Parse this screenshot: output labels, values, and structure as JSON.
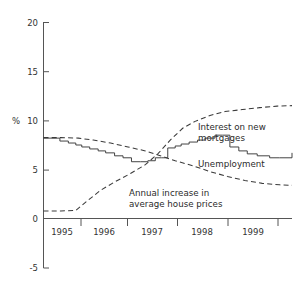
{
  "chart_data": {
    "type": "line",
    "title": "",
    "xlabel": "",
    "ylabel": "%",
    "ylim": [
      -5,
      20
    ],
    "xlim": [
      1994.85,
      1999.85
    ],
    "grid": false,
    "legend_position": "inline-annotations",
    "yticks": [
      "-5",
      "0",
      "5",
      "10",
      "15",
      "20"
    ],
    "ytick_values": [
      -5,
      0,
      5,
      10,
      15,
      20
    ],
    "xticks": [
      "1995",
      "1996",
      "1997",
      "1998",
      "1999"
    ],
    "xtick_values": [
      1995,
      1996,
      1997,
      1998,
      1999
    ],
    "series": [
      {
        "name": "Interest on new mortgages",
        "style": "step",
        "x": [
          1994.85,
          1995.1,
          1995.18,
          1995.35,
          1995.5,
          1995.62,
          1995.78,
          1995.95,
          1996.1,
          1996.28,
          1996.45,
          1996.62,
          1996.8,
          1996.95,
          1997.1,
          1997.22,
          1997.35,
          1997.5,
          1997.62,
          1997.78,
          1997.95,
          1998.1,
          1998.3,
          1998.45,
          1998.6,
          1998.78,
          1998.95,
          1999.15,
          1999.4,
          1999.6,
          1999.85
        ],
        "y": [
          8.2,
          8.2,
          7.9,
          7.7,
          7.5,
          7.3,
          7.1,
          6.9,
          6.7,
          6.4,
          6.2,
          5.8,
          5.8,
          5.9,
          6.2,
          6.2,
          7.2,
          7.4,
          7.6,
          7.8,
          8.0,
          8.2,
          8.5,
          8.5,
          7.3,
          6.9,
          6.6,
          6.4,
          6.2,
          6.2,
          6.7
        ]
      },
      {
        "name": "Unemployment",
        "style": "dashed",
        "x": [
          1994.85,
          1995.2,
          1995.55,
          1995.85,
          1996.2,
          1996.55,
          1996.9,
          1997.2,
          1997.5,
          1997.85,
          1998.2,
          1998.55,
          1998.9,
          1999.25,
          1999.6,
          1999.85
        ],
        "y": [
          8.25,
          8.25,
          8.2,
          8.0,
          7.7,
          7.3,
          6.9,
          6.4,
          5.9,
          5.4,
          4.8,
          4.3,
          3.9,
          3.6,
          3.45,
          3.4
        ]
      },
      {
        "name": "Annual increase in average house prices",
        "style": "dashed",
        "x": [
          1994.85,
          1995.2,
          1995.5,
          1995.75,
          1996.0,
          1996.3,
          1996.6,
          1996.9,
          1997.15,
          1997.4,
          1997.65,
          1997.9,
          1998.2,
          1998.5,
          1998.85,
          1999.2,
          1999.55,
          1999.85
        ],
        "y": [
          0.8,
          0.8,
          0.85,
          1.9,
          2.9,
          3.8,
          4.6,
          5.5,
          6.6,
          8.0,
          9.2,
          9.9,
          10.5,
          10.9,
          11.1,
          11.3,
          11.45,
          11.5
        ]
      }
    ],
    "annotations": [
      {
        "name": "interest-label",
        "text_line1": "Interest on new",
        "text_line2": "mortgages"
      },
      {
        "name": "unemployment-label",
        "text": "Unemployment"
      },
      {
        "name": "house-prices-label",
        "text_line1": "Annual increase in",
        "text_line2": "average house prices"
      }
    ],
    "colors": {
      "axis": "#555555",
      "curve": "#3a3a3a",
      "text": "#333333",
      "background": "#ffffff"
    }
  }
}
